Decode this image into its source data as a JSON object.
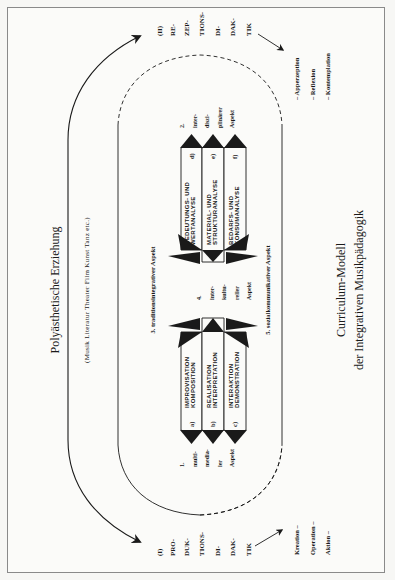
{
  "figure": {
    "title": "Polyästhetische Erziehung",
    "subtitle": "(Musik  Literatur  Theater  Film  Kunst  Tanz  etc.)",
    "caption_line1": "Curriculum-Modell",
    "caption_line2": "der Integrativen Musikpädagogik"
  },
  "poles": {
    "production": {
      "lines": [
        "(I)",
        "PRO-",
        "DUK-",
        "TIONS-",
        "DI-",
        "DAK-",
        "TIK"
      ],
      "modes": [
        "Kreation  –",
        "Operation  –",
        "Aktion  –"
      ]
    },
    "reception": {
      "lines": [
        "(II)",
        "RE-",
        "ZEP-",
        "TIONS-",
        "DI-",
        "DAK-",
        "TIK"
      ],
      "modes": [
        "–  Apperzeption",
        "–  Reflexion",
        "–  Kontemplation"
      ]
    }
  },
  "aspects": {
    "a3": "3. traditionsintegrativer Aspekt",
    "a5": "5. sozialkommunikativer Aspekt",
    "a1": [
      "1.",
      "multi-",
      "media-",
      "ler",
      "Aspekt"
    ],
    "a2": [
      "2.",
      "inter-",
      "diszi-",
      "plinärer",
      "Aspekt"
    ],
    "a4": [
      "4.",
      "inter-",
      "kultu-",
      "reller",
      "Aspekt"
    ]
  },
  "left_strips": [
    {
      "letter": "a)",
      "line1": "IMPROVISATION",
      "line2": "KOMPOSITION"
    },
    {
      "letter": "b)",
      "line1": "REALISATION",
      "line2": "INTERPRETATION"
    },
    {
      "letter": "c)",
      "line1": "INTERAKTION",
      "line2": "DEMONSTRATION"
    }
  ],
  "right_strips": [
    {
      "letter": "d)",
      "line1": "BEDEUTUNGS- UND",
      "line2": "WERTANALYSE"
    },
    {
      "letter": "e)",
      "line1": "MATERIAL- UND",
      "line2": "STRUKTURANALYSE"
    },
    {
      "letter": "f)",
      "line1": "BEDARFS- UND",
      "line2": "KONSUMANALYSE"
    }
  ],
  "colors": {
    "ink": "#1a1a1a",
    "paper": "#fbfbf9",
    "frame": "#8a8a8a"
  }
}
